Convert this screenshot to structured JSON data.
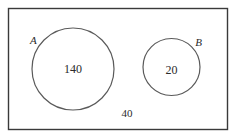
{
  "diagram": {
    "type": "venn",
    "title": "",
    "universe": {
      "label": "",
      "outside_count": "40",
      "border_color": "#3a3a3a"
    },
    "sets": [
      {
        "id": "A",
        "label": "A",
        "count": "140",
        "stroke_color": "#5a5a5a"
      },
      {
        "id": "B",
        "label": "B",
        "count": "20",
        "stroke_color": "#5a5a5a"
      }
    ],
    "overlap": {
      "present": false,
      "count": ""
    }
  }
}
